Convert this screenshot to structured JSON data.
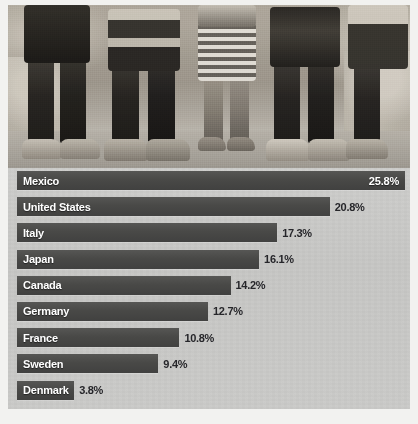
{
  "image": {
    "alt_description": "black-and-white photograph of nine children's legs and feet standing on dirt ground",
    "caption": ""
  },
  "chart_data": {
    "type": "bar",
    "orientation": "horizontal",
    "title": "",
    "subtitle": "",
    "xlabel": "",
    "ylabel": "",
    "unit": "%",
    "grid": false,
    "legend": false,
    "xlim": [
      0,
      25.8
    ],
    "categories": [
      "Mexico",
      "United States",
      "Italy",
      "Japan",
      "Canada",
      "Germany",
      "France",
      "Sweden",
      "Denmark"
    ],
    "values": [
      25.8,
      20.8,
      17.3,
      16.1,
      14.2,
      12.7,
      10.8,
      9.4,
      3.8
    ],
    "value_labels": [
      "25.8%",
      "20.8%",
      "17.3%",
      "16.1%",
      "14.2%",
      "12.7%",
      "10.8%",
      "9.4%",
      "3.8%"
    ],
    "bars": [
      {
        "label": "Mexico",
        "value": 25.8,
        "value_label": "25.8%",
        "label_inside": true,
        "value_inside": true
      },
      {
        "label": "United States",
        "value": 20.8,
        "value_label": "20.8%",
        "label_inside": true,
        "value_inside": false
      },
      {
        "label": "Italy",
        "value": 17.3,
        "value_label": "17.3%",
        "label_inside": true,
        "value_inside": false
      },
      {
        "label": "Japan",
        "value": 16.1,
        "value_label": "16.1%",
        "label_inside": true,
        "value_inside": false
      },
      {
        "label": "Canada",
        "value": 14.2,
        "value_label": "14.2%",
        "label_inside": true,
        "value_inside": false
      },
      {
        "label": "Germany",
        "value": 12.7,
        "value_label": "12.7%",
        "label_inside": true,
        "value_inside": false
      },
      {
        "label": "France",
        "value": 10.8,
        "value_label": "10.8%",
        "label_inside": true,
        "value_inside": false
      },
      {
        "label": "Sweden",
        "value": 9.4,
        "value_label": "9.4%",
        "label_inside": true,
        "value_inside": false
      },
      {
        "label": "Denmark",
        "value": 3.8,
        "value_label": "3.8%",
        "label_inside": true,
        "value_inside": false
      }
    ],
    "colors": {
      "bar": "#494947",
      "panel_background": "#c8c8c6",
      "bar_label_text": "#ffffff",
      "value_label_text": "#26262a",
      "page_background": "#ffffff"
    }
  }
}
